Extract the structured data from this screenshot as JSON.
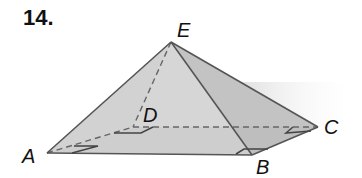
{
  "problem": {
    "number": "14."
  },
  "figure": {
    "type": "square pyramid",
    "vertices": {
      "E": {
        "label": "E",
        "x": 171,
        "y": 42
      },
      "A": {
        "label": "A",
        "x": 47,
        "y": 153
      },
      "B": {
        "label": "B",
        "x": 252,
        "y": 155
      },
      "C": {
        "label": "C",
        "x": 318,
        "y": 127
      },
      "D": {
        "label": "D",
        "x": 133,
        "y": 127
      }
    },
    "visible_edges": [
      "EA",
      "EB",
      "EC",
      "AB",
      "BC"
    ],
    "hidden_edges": [
      "ED",
      "AD",
      "DC"
    ],
    "right_angle_marks": [
      "A",
      "B",
      "C",
      "D"
    ],
    "colors": {
      "edge": "#5a5a5a",
      "face_left": "#d9d9d9",
      "face_front": "#c4c4c4",
      "face_right": "#b8b8b8",
      "base": "#c8c8c8",
      "shadow": "#e6e6e6"
    }
  }
}
